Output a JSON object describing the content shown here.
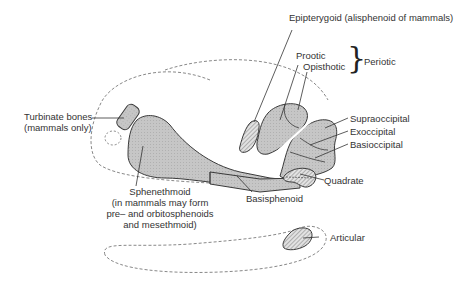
{
  "diagram": {
    "type": "anatomical-schematic",
    "colors": {
      "bone_fill": "#c4c4c4",
      "hatched_fill": "#d8d8d8",
      "outline": "#3a3a3a",
      "dashed_outline": "#6a6a6a",
      "label_text": "#333333"
    },
    "labels": {
      "epipterygoid": "Epipterygoid (alisphenoid of mammals)",
      "prootic": "Prootic",
      "opisthotic": "Opisthotic",
      "periotic": "Periotic",
      "periotic_brace": "}",
      "supraoccipital": "Supraoccipital",
      "exoccipital": "Exoccipital",
      "basioccipital": "Basioccipital",
      "quadrate": "Quadrate",
      "basisphenoid": "Basisphenoid",
      "turbinate_line1": "Turbinate bones",
      "turbinate_line2": "(mammals only)",
      "sphenethmoid_line1": "Sphenethmoid",
      "sphenethmoid_line2": "(in mammals may form",
      "sphenethmoid_line3": "pre– and orbitosphenoids",
      "sphenethmoid_line4": "and mesethmoid)",
      "articular": "Articular"
    },
    "groups": [
      {
        "name": "Periotic",
        "members": [
          "Prootic",
          "Opisthotic"
        ]
      }
    ]
  }
}
